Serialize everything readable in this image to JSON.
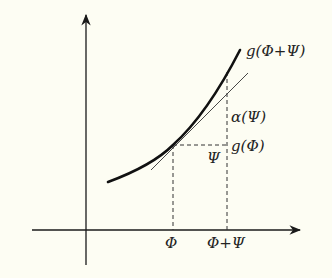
{
  "figure": {
    "background": "#fdfdf3",
    "ink": "#1a1a1a",
    "labels": {
      "curve_top": "g(Φ+Ψ)",
      "alpha": "α(Ψ)",
      "g_phi": "g(Φ)",
      "psi_step": "Ψ",
      "x_phi": "Φ",
      "x_phi_plus_psi": "Φ+Ψ"
    },
    "elements": {
      "x_axis": "horizontal axis with arrow",
      "y_axis": "vertical axis with arrow",
      "curve": "convex increasing function g",
      "tangent": "tangent line at Φ",
      "dashed_guides": "dashed projections at Φ and Φ+Ψ"
    }
  }
}
